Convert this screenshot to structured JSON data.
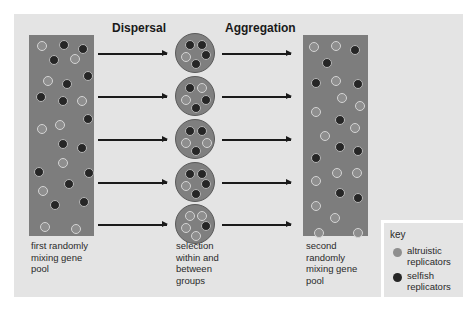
{
  "diagram": {
    "stage_titles": {
      "dispersal": "Dispersal",
      "aggregation": "Aggregation"
    },
    "captions": {
      "first_pool": "first randomly\nmixing gene\npool",
      "groups": "selection\nwithin and\nbetween\ngroups",
      "second_pool": "second\nrandomly\nmixing gene\npool"
    },
    "key": {
      "title": "key",
      "items": [
        {
          "label": "altruistic\nreplicators",
          "type": "altruistic",
          "color": "#8e8e8e"
        },
        {
          "label": "selfish\nreplicators",
          "type": "selfish",
          "color": "#262626"
        }
      ]
    },
    "colors": {
      "panel": "#e4e4e4",
      "pool": "#7d7d7d",
      "altruistic": "#8e8e8e",
      "selfish": "#262626"
    },
    "first_pool_dots": [
      {
        "x": 8,
        "y": 6,
        "t": "alt"
      },
      {
        "x": 30,
        "y": 5,
        "t": "self"
      },
      {
        "x": 49,
        "y": 9,
        "t": "self"
      },
      {
        "x": 20,
        "y": 20,
        "t": "self"
      },
      {
        "x": 41,
        "y": 19,
        "t": "alt"
      },
      {
        "x": 14,
        "y": 41,
        "t": "alt"
      },
      {
        "x": 54,
        "y": 36,
        "t": "self"
      },
      {
        "x": 33,
        "y": 44,
        "t": "self"
      },
      {
        "x": 7,
        "y": 57,
        "t": "self"
      },
      {
        "x": 29,
        "y": 61,
        "t": "self"
      },
      {
        "x": 48,
        "y": 61,
        "t": "alt"
      },
      {
        "x": 54,
        "y": 79,
        "t": "self"
      },
      {
        "x": 26,
        "y": 85,
        "t": "alt"
      },
      {
        "x": 8,
        "y": 89,
        "t": "alt"
      },
      {
        "x": 29,
        "y": 104,
        "t": "self"
      },
      {
        "x": 48,
        "y": 108,
        "t": "self"
      },
      {
        "x": 29,
        "y": 123,
        "t": "alt"
      },
      {
        "x": 5,
        "y": 132,
        "t": "self"
      },
      {
        "x": 55,
        "y": 133,
        "t": "self"
      },
      {
        "x": 35,
        "y": 144,
        "t": "self"
      },
      {
        "x": 9,
        "y": 151,
        "t": "alt"
      },
      {
        "x": 21,
        "y": 165,
        "t": "self"
      },
      {
        "x": 50,
        "y": 162,
        "t": "self"
      },
      {
        "x": 11,
        "y": 187,
        "t": "alt"
      },
      {
        "x": 42,
        "y": 189,
        "t": "alt"
      }
    ],
    "second_pool_dots": [
      {
        "x": 6,
        "y": 7,
        "t": "alt"
      },
      {
        "x": 28,
        "y": 6,
        "t": "alt"
      },
      {
        "x": 47,
        "y": 10,
        "t": "self"
      },
      {
        "x": 19,
        "y": 23,
        "t": "self"
      },
      {
        "x": 8,
        "y": 43,
        "t": "self"
      },
      {
        "x": 28,
        "y": 41,
        "t": "alt"
      },
      {
        "x": 50,
        "y": 44,
        "t": "self"
      },
      {
        "x": 34,
        "y": 58,
        "t": "alt"
      },
      {
        "x": 52,
        "y": 66,
        "t": "alt"
      },
      {
        "x": 8,
        "y": 72,
        "t": "alt"
      },
      {
        "x": 32,
        "y": 80,
        "t": "self"
      },
      {
        "x": 47,
        "y": 88,
        "t": "alt"
      },
      {
        "x": 17,
        "y": 96,
        "t": "alt"
      },
      {
        "x": 32,
        "y": 107,
        "t": "self"
      },
      {
        "x": 50,
        "y": 111,
        "t": "self"
      },
      {
        "x": 8,
        "y": 118,
        "t": "self"
      },
      {
        "x": 29,
        "y": 133,
        "t": "alt"
      },
      {
        "x": 49,
        "y": 133,
        "t": "alt"
      },
      {
        "x": 8,
        "y": 141,
        "t": "alt"
      },
      {
        "x": 32,
        "y": 153,
        "t": "self"
      },
      {
        "x": 50,
        "y": 158,
        "t": "self"
      },
      {
        "x": 8,
        "y": 166,
        "t": "alt"
      },
      {
        "x": 27,
        "y": 178,
        "t": "alt"
      },
      {
        "x": 11,
        "y": 193,
        "t": "alt"
      },
      {
        "x": 50,
        "y": 193,
        "t": "alt"
      }
    ],
    "groups": [
      {
        "cy": 53,
        "dots": [
          {
            "x": 9,
            "y": 6,
            "t": "self"
          },
          {
            "x": 21,
            "y": 6,
            "t": "self"
          },
          {
            "x": 5,
            "y": 18,
            "t": "alt"
          },
          {
            "x": 25,
            "y": 16,
            "t": "self"
          },
          {
            "x": 15,
            "y": 25,
            "t": "self"
          }
        ]
      },
      {
        "cy": 96,
        "dots": [
          {
            "x": 9,
            "y": 6,
            "t": "self"
          },
          {
            "x": 21,
            "y": 6,
            "t": "alt"
          },
          {
            "x": 5,
            "y": 18,
            "t": "alt"
          },
          {
            "x": 25,
            "y": 18,
            "t": "self"
          },
          {
            "x": 15,
            "y": 26,
            "t": "self"
          }
        ]
      },
      {
        "cy": 139,
        "dots": [
          {
            "x": 9,
            "y": 6,
            "t": "self"
          },
          {
            "x": 21,
            "y": 6,
            "t": "self"
          },
          {
            "x": 5,
            "y": 18,
            "t": "alt"
          },
          {
            "x": 26,
            "y": 18,
            "t": "alt"
          },
          {
            "x": 15,
            "y": 26,
            "t": "self"
          }
        ]
      },
      {
        "cy": 182,
        "dots": [
          {
            "x": 9,
            "y": 6,
            "t": "self"
          },
          {
            "x": 21,
            "y": 6,
            "t": "self"
          },
          {
            "x": 5,
            "y": 18,
            "t": "alt"
          },
          {
            "x": 25,
            "y": 16,
            "t": "self"
          },
          {
            "x": 15,
            "y": 26,
            "t": "self"
          }
        ]
      },
      {
        "cy": 224,
        "dots": [
          {
            "x": 9,
            "y": 6,
            "t": "alt"
          },
          {
            "x": 21,
            "y": 6,
            "t": "alt"
          },
          {
            "x": 5,
            "y": 18,
            "t": "alt"
          },
          {
            "x": 25,
            "y": 16,
            "t": "self"
          },
          {
            "x": 15,
            "y": 26,
            "t": "alt"
          }
        ]
      }
    ]
  }
}
